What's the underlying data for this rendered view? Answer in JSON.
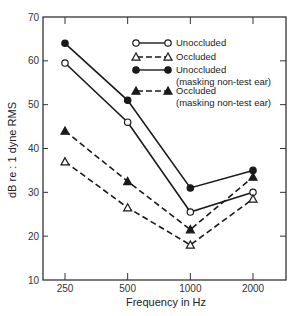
{
  "chart_data": {
    "type": "line",
    "title": "",
    "xlabel": "Frequency in Hz",
    "ylabel": "dB re : 1 dyne RMS",
    "x": [
      250,
      500,
      1000,
      2000
    ],
    "categories": [
      "250",
      "500",
      "1000",
      "2000"
    ],
    "x_scale": "log",
    "ylim": [
      10,
      70
    ],
    "yticks": [
      10,
      20,
      30,
      40,
      50,
      60,
      70
    ],
    "grid": false,
    "legend_position": "upper right (inside plot)",
    "series": [
      {
        "name": "Unoccluded",
        "marker": "open-circle",
        "line_style": "solid",
        "values": [
          59.5,
          46,
          25.5,
          30
        ]
      },
      {
        "name": "Occluded",
        "marker": "open-triangle",
        "line_style": "dashed",
        "values": [
          37,
          26.5,
          18,
          28.5
        ]
      },
      {
        "name": "Unoccluded (masking non-test ear)",
        "marker": "filled-circle",
        "line_style": "solid",
        "values": [
          64,
          51,
          31,
          35
        ]
      },
      {
        "name": "Occluded (masking non-test ear)",
        "marker": "filled-triangle",
        "line_style": "dashed",
        "values": [
          44,
          32.5,
          21.5,
          33.5
        ]
      }
    ]
  },
  "axes": {
    "x_title": "Frequency in Hz",
    "y_title": "dB re : 1 dyne RMS",
    "x_ticks": [
      "250",
      "500",
      "1000",
      "2000"
    ],
    "y_ticks": [
      "10",
      "20",
      "30",
      "40",
      "50",
      "60",
      "70"
    ]
  },
  "legend": {
    "items": [
      {
        "label": "Unoccluded",
        "sublabel": "",
        "marker": "open-circle",
        "line": "solid"
      },
      {
        "label": "Occluded",
        "sublabel": "",
        "marker": "open-triangle",
        "line": "dashed"
      },
      {
        "label": "Unoccluded",
        "sublabel": "(masking non-test ear)",
        "marker": "filled-circle",
        "line": "solid"
      },
      {
        "label": "Occluded",
        "sublabel": "(masking non-test ear)",
        "marker": "filled-triangle",
        "line": "dashed"
      }
    ]
  },
  "colors": {
    "ink": "#1a1a1a",
    "frame": "#333333",
    "background": "#ffffff"
  }
}
